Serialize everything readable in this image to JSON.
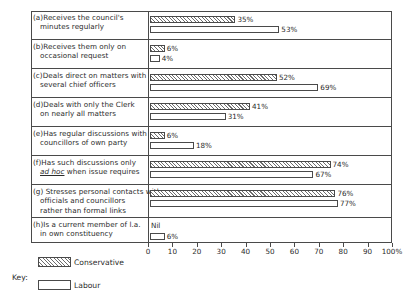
{
  "chart_data": {
    "type": "bar",
    "orientation": "horizontal",
    "title": "",
    "xlabel": "",
    "ylabel": "",
    "xlim": [
      0,
      100
    ],
    "xticks": [
      0,
      10,
      20,
      30,
      40,
      50,
      60,
      70,
      80,
      90,
      100
    ],
    "xtick_labels": [
      "0",
      "10",
      "20",
      "30",
      "40",
      "50",
      "60",
      "70",
      "80",
      "90",
      "100%"
    ],
    "grid": false,
    "legend_position": "bottom-left",
    "categories": [
      "(a)Receives the council's minutes regularly",
      "(b)Receives them only on occasional request",
      "(c)Deals direct on matters with several chief officers",
      "(d)Deals with only the Clerk on nearly all matters",
      "(e)Has regular discussions with councillors of own party",
      "(f)Has such discussions only ad hoc when issue requires",
      "(g)Stresses personal contacts with officials and councillors rather than formal links",
      "(h)Is a current member of l.a. in own constituency"
    ],
    "series": [
      {
        "name": "Conservative",
        "values": [
          35,
          6,
          52,
          41,
          6,
          74,
          76,
          0
        ],
        "labels": [
          "35%",
          "6%",
          "52%",
          "41%",
          "6%",
          "74%",
          "76%",
          "Nil"
        ]
      },
      {
        "name": "Labour",
        "values": [
          53,
          4,
          69,
          31,
          18,
          67,
          77,
          6
        ],
        "labels": [
          "53%",
          "4%",
          "69%",
          "31%",
          "18%",
          "67%",
          "77%",
          "6%"
        ]
      }
    ]
  },
  "rows": [
    {
      "id": "a",
      "lines": [
        "(a)Receives the council's",
        "minutes regularly"
      ],
      "cons_label": "35%",
      "lab_label": "53%"
    },
    {
      "id": "b",
      "lines": [
        "(b)Receives them only on",
        "occasional request"
      ],
      "cons_label": "6%",
      "lab_label": "4%"
    },
    {
      "id": "c",
      "lines": [
        "(c)Deals direct on matters with",
        "several chief officers"
      ],
      "cons_label": "52%",
      "lab_label": "69%"
    },
    {
      "id": "d",
      "lines": [
        "(d)Deals with only the Clerk",
        "on nearly all matters"
      ],
      "cons_label": "41%",
      "lab_label": "31%"
    },
    {
      "id": "e",
      "lines": [
        "(e)Has regular discussions with",
        "councillors of own party"
      ],
      "cons_label": "6%",
      "lab_label": "18%"
    },
    {
      "id": "f",
      "lines": [
        "(f)Has such discussions only",
        "ad hoc when issue requires"
      ],
      "cons_label": "74%",
      "lab_label": "67%"
    },
    {
      "id": "g",
      "lines": [
        "(g) Stresses personal contacts with",
        "officials and councillors",
        "rather than formal links"
      ],
      "cons_label": "76%",
      "lab_label": "77%"
    },
    {
      "id": "h",
      "lines": [
        "(h)Is a current member of l.a.",
        "in own constituency"
      ],
      "cons_label": "Nil",
      "lab_label": "6%"
    }
  ],
  "key": {
    "title": "Key:",
    "conservative_label": "Conservative",
    "labour_label": "Labour"
  },
  "colors": {
    "ink": "#2b2b2b",
    "rule": "#4a4a4a",
    "hatch": "#6d6d6d",
    "paper": "#ffffff"
  }
}
